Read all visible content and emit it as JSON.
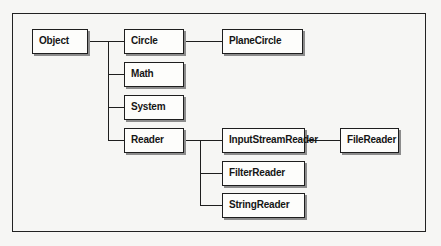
{
  "diagram": {
    "nodes": {
      "object": "Object",
      "circle": "Circle",
      "planecircle": "PlaneCircle",
      "math": "Math",
      "system": "System",
      "reader": "Reader",
      "inputstreamreader": "InputStreamReader",
      "filereader": "FileReader",
      "filterreader": "FilterReader",
      "stringreader": "StringReader"
    },
    "edges": [
      {
        "from": "Object",
        "to": "Circle"
      },
      {
        "from": "Object",
        "to": "Math"
      },
      {
        "from": "Object",
        "to": "System"
      },
      {
        "from": "Object",
        "to": "Reader"
      },
      {
        "from": "Circle",
        "to": "PlaneCircle"
      },
      {
        "from": "Reader",
        "to": "InputStreamReader"
      },
      {
        "from": "Reader",
        "to": "FilterReader"
      },
      {
        "from": "Reader",
        "to": "StringReader"
      },
      {
        "from": "InputStreamReader",
        "to": "FileReader"
      }
    ],
    "colors": {
      "background": "#f6f6f4",
      "box_fill": "#fdfdfb",
      "line": "#1e1e1e",
      "shadow": "#8c8c8c"
    }
  }
}
